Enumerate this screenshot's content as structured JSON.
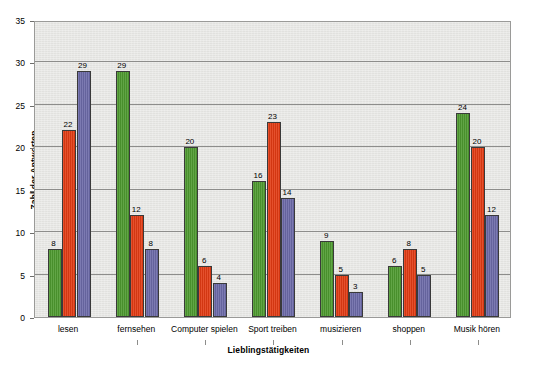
{
  "chart_data": {
    "type": "bar",
    "title": "",
    "xlabel": "Lieblingstätigkeiten",
    "ylabel": "Zahl der Antworten",
    "ylim": [
      0,
      35
    ],
    "ytick_step": 5,
    "yticks": [
      0,
      5,
      10,
      15,
      20,
      25,
      30,
      35
    ],
    "grid": true,
    "legend": "none",
    "categories": [
      "lesen",
      "fernsehen",
      "Computer spielen",
      "Sport treiben",
      "musizieren",
      "shoppen",
      "Musik hören"
    ],
    "series": [
      {
        "name": "series-1",
        "color": "#4e9a2f",
        "values": [
          8,
          29,
          20,
          16,
          9,
          6,
          24
        ]
      },
      {
        "name": "series-2",
        "color": "#e23b13",
        "values": [
          22,
          12,
          6,
          23,
          5,
          8,
          20
        ]
      },
      {
        "name": "series-3",
        "color": "#6c6aa8",
        "values": [
          29,
          8,
          4,
          14,
          3,
          5,
          12
        ]
      }
    ],
    "data_labels": [
      [
        "8",
        "22",
        "29"
      ],
      [
        "29",
        "12",
        "8"
      ],
      [
        "20",
        "6",
        "4"
      ],
      [
        "16",
        "23",
        "14"
      ],
      [
        "9",
        "5",
        "3"
      ],
      [
        "6",
        "8",
        "5"
      ],
      [
        "24",
        "20",
        "12"
      ]
    ],
    "colors": {
      "plot_background": "#e7e7e4",
      "page_background": "#ffffff",
      "gridline": "#8d8d8b",
      "axis": "#6e6e6c",
      "bar_outline": "#3a3a3a"
    }
  }
}
